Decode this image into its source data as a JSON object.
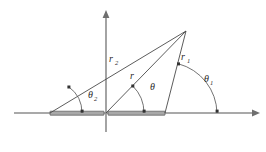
{
  "figure": {
    "background_color": "#ffffff",
    "axes": {
      "x_axis_name": "horizontal-axis",
      "y_axis_name": "vertical-axis",
      "axis_color": "#8d8d8d",
      "x_axis_y": 113,
      "y_axis_x": 106,
      "x_axis_start": 14,
      "x_axis_end": 258,
      "y_axis_top": 12,
      "y_axis_bottom": 132
    },
    "aperture_bar": {
      "name": "aperture-bar",
      "x_start": 50,
      "x_end": 165,
      "thickness": 4,
      "fill_color": "#a8a8a8",
      "stroke_color": "#555555"
    },
    "apex_point": {
      "x": 186,
      "y": 31,
      "name": "field-point-P"
    },
    "vertices": [
      {
        "name": "left-endpoint",
        "x": 50,
        "y": 113
      },
      {
        "name": "origin-point",
        "x": 106,
        "y": 113
      },
      {
        "name": "right-endpoint",
        "x": 165,
        "y": 113
      }
    ],
    "rays": [
      {
        "name": "ray-r2",
        "from_x": 50,
        "from_y": 113,
        "label": "r",
        "subscript": "2",
        "label_x": 111,
        "label_y": 59
      },
      {
        "name": "ray-r",
        "from_x": 106,
        "from_y": 113,
        "label": "r",
        "subscript": "",
        "label_x": 131,
        "label_y": 76
      },
      {
        "name": "ray-r1",
        "from_x": 165,
        "from_y": 113,
        "label": "r",
        "subscript": "1",
        "label_x": 183,
        "label_y": 57
      }
    ],
    "angles": [
      {
        "name": "angle-theta2",
        "label": "θ",
        "subscript": "2",
        "vertex_x": 50,
        "vertex_y": 113,
        "radius": 32,
        "label_x": 90,
        "label_y": 95,
        "degrees": 56
      },
      {
        "name": "angle-theta",
        "label": "θ",
        "subscript": "",
        "vertex_x": 106,
        "vertex_y": 113,
        "radius": 38,
        "label_x": 152,
        "label_y": 87,
        "degrees": 48
      },
      {
        "name": "angle-theta1",
        "label": "θ",
        "subscript": "1",
        "vertex_x": 165,
        "vertex_y": 113,
        "radius": 52,
        "label_x": 207,
        "label_y": 80,
        "degrees": 73
      }
    ],
    "arrow_heads": [
      {
        "name": "x-axis-arrow",
        "direction": "right"
      },
      {
        "name": "y-axis-arrow",
        "direction": "up"
      }
    ]
  }
}
